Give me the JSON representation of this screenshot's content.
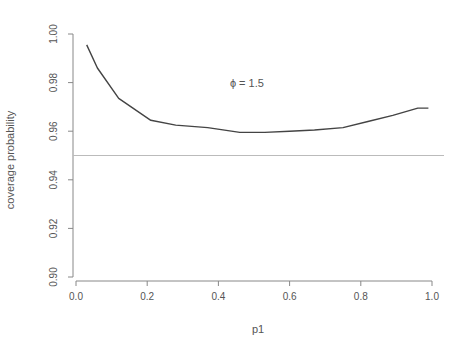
{
  "chart_data": {
    "type": "line",
    "title": "",
    "xlabel": "p1",
    "ylabel": "coverage probability",
    "xlim": [
      0.0,
      1.0
    ],
    "ylim": [
      0.9,
      1.0
    ],
    "xticks": [
      "0.0",
      "0.2",
      "0.4",
      "0.6",
      "0.8",
      "1.0"
    ],
    "yticks": [
      "0.90",
      "0.92",
      "0.94",
      "0.96",
      "0.98",
      "1.00"
    ],
    "grid": false,
    "legend": null,
    "annotations": [
      {
        "text": "ϕ = 1.5",
        "x": 0.48,
        "y": 0.98
      }
    ],
    "reference_lines": [
      {
        "orientation": "horizontal",
        "y": 0.95,
        "color": "#bbbbbb"
      }
    ],
    "series": [
      {
        "name": "coverage",
        "color": "#444444",
        "x": [
          0.03,
          0.06,
          0.12,
          0.21,
          0.28,
          0.37,
          0.46,
          0.53,
          0.6,
          0.67,
          0.75,
          0.82,
          0.89,
          0.96,
          0.99
        ],
        "values": [
          0.9955,
          0.986,
          0.9735,
          0.9645,
          0.9625,
          0.9615,
          0.9595,
          0.9595,
          0.96,
          0.9605,
          0.9615,
          0.964,
          0.9665,
          0.9695,
          0.9695
        ]
      }
    ]
  }
}
